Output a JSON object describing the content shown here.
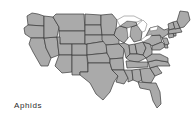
{
  "figure": {
    "kind": "choropleth-map",
    "region": "United States (contiguous 48 states)",
    "label": "Aphids",
    "background_color": "#ffffff",
    "land_fill_color": "#aaaaaa",
    "border_color": "#3a3a3a",
    "water_fill_color": "#ffffff",
    "label_color": "#2b2b2b"
  },
  "legend": {
    "entries": [
      {
        "label": "Aphids",
        "color": "#aaaaaa"
      }
    ]
  },
  "map": {
    "title": "",
    "water_bodies": [
      {
        "name": "lake-superior"
      },
      {
        "name": "lake-michigan"
      },
      {
        "name": "lake-huron"
      },
      {
        "name": "lake-erie"
      },
      {
        "name": "lake-ontario"
      }
    ],
    "states": [
      {
        "code": "WA",
        "name": "Washington",
        "shaded": true
      },
      {
        "code": "OR",
        "name": "Oregon",
        "shaded": true
      },
      {
        "code": "CA",
        "name": "California",
        "shaded": true
      },
      {
        "code": "NV",
        "name": "Nevada",
        "shaded": true
      },
      {
        "code": "ID",
        "name": "Idaho",
        "shaded": true
      },
      {
        "code": "MT",
        "name": "Montana",
        "shaded": true
      },
      {
        "code": "WY",
        "name": "Wyoming",
        "shaded": true
      },
      {
        "code": "UT",
        "name": "Utah",
        "shaded": true
      },
      {
        "code": "AZ",
        "name": "Arizona",
        "shaded": true
      },
      {
        "code": "NM",
        "name": "New Mexico",
        "shaded": true
      },
      {
        "code": "CO",
        "name": "Colorado",
        "shaded": true
      },
      {
        "code": "ND",
        "name": "North Dakota",
        "shaded": true
      },
      {
        "code": "SD",
        "name": "South Dakota",
        "shaded": true
      },
      {
        "code": "NE",
        "name": "Nebraska",
        "shaded": true
      },
      {
        "code": "KS",
        "name": "Kansas",
        "shaded": true
      },
      {
        "code": "OK",
        "name": "Oklahoma",
        "shaded": true
      },
      {
        "code": "TX",
        "name": "Texas",
        "shaded": true
      },
      {
        "code": "MN",
        "name": "Minnesota",
        "shaded": true
      },
      {
        "code": "IA",
        "name": "Iowa",
        "shaded": true
      },
      {
        "code": "MO",
        "name": "Missouri",
        "shaded": true
      },
      {
        "code": "AR",
        "name": "Arkansas",
        "shaded": true
      },
      {
        "code": "LA",
        "name": "Louisiana",
        "shaded": true
      },
      {
        "code": "WI",
        "name": "Wisconsin",
        "shaded": true
      },
      {
        "code": "IL",
        "name": "Illinois",
        "shaded": true
      },
      {
        "code": "MS",
        "name": "Mississippi",
        "shaded": true
      },
      {
        "code": "MI",
        "name": "Michigan",
        "shaded": true
      },
      {
        "code": "IN",
        "name": "Indiana",
        "shaded": true
      },
      {
        "code": "OH",
        "name": "Ohio",
        "shaded": true
      },
      {
        "code": "KY",
        "name": "Kentucky",
        "shaded": true
      },
      {
        "code": "TN",
        "name": "Tennessee",
        "shaded": true
      },
      {
        "code": "AL",
        "name": "Alabama",
        "shaded": true
      },
      {
        "code": "GA",
        "name": "Georgia",
        "shaded": true
      },
      {
        "code": "FL",
        "name": "Florida",
        "shaded": true
      },
      {
        "code": "SC",
        "name": "South Carolina",
        "shaded": true
      },
      {
        "code": "NC",
        "name": "North Carolina",
        "shaded": true
      },
      {
        "code": "VA",
        "name": "Virginia",
        "shaded": true
      },
      {
        "code": "WV",
        "name": "West Virginia",
        "shaded": true
      },
      {
        "code": "PA",
        "name": "Pennsylvania",
        "shaded": true
      },
      {
        "code": "NY",
        "name": "New York",
        "shaded": true
      },
      {
        "code": "MD",
        "name": "Maryland",
        "shaded": true
      },
      {
        "code": "DE",
        "name": "Delaware",
        "shaded": true
      },
      {
        "code": "NJ",
        "name": "New Jersey",
        "shaded": true
      },
      {
        "code": "CT",
        "name": "Connecticut",
        "shaded": true
      },
      {
        "code": "RI",
        "name": "Rhode Island",
        "shaded": true
      },
      {
        "code": "MA",
        "name": "Massachusetts",
        "shaded": true
      },
      {
        "code": "VT",
        "name": "Vermont",
        "shaded": true
      },
      {
        "code": "NH",
        "name": "New Hampshire",
        "shaded": true
      },
      {
        "code": "ME",
        "name": "Maine",
        "shaded": true
      }
    ]
  }
}
